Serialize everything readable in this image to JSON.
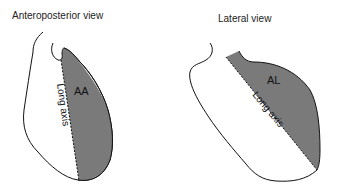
{
  "figure": {
    "panels": [
      {
        "title": "Anteroposterior view",
        "region_label": "AA",
        "axis_label": "Long axis"
      },
      {
        "title": "Lateral view",
        "region_label": "AL",
        "axis_label": "Long axis"
      }
    ],
    "colors": {
      "shaded_region": "#7a7a7a",
      "outline": "#111111",
      "background": "#ffffff"
    }
  }
}
